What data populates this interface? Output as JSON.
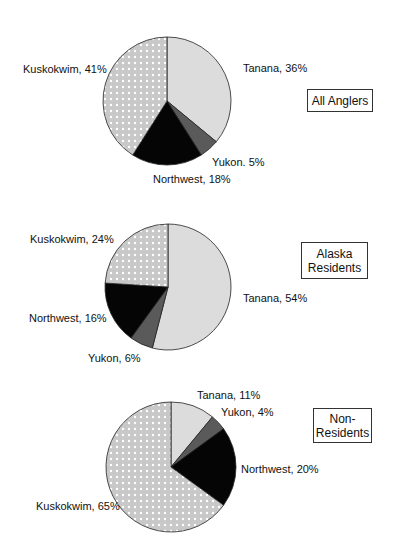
{
  "colors": {
    "Tanana": "#dcdcdc",
    "Yukon": "#5a5a5a",
    "Northwest": "#050505",
    "Kuskokwim": "#c8c8c8",
    "dot": "#ffffff",
    "outline": "#222222"
  },
  "chart_data": [
    {
      "type": "pie",
      "title": "All Anglers",
      "categories": [
        "Tanana",
        "Yukon",
        "Northwest",
        "Kuskokwim"
      ],
      "values": [
        36,
        5,
        18,
        41
      ],
      "labels": [
        "Tanana, 36%",
        "Yukon. 5%",
        "Northwest, 18%",
        "Kuskokwim, 41%"
      ],
      "start_angle_deg": 0,
      "direction": "clockwise"
    },
    {
      "type": "pie",
      "title": "Alaska Residents",
      "title_lines": [
        "Alaska",
        "Residents"
      ],
      "categories": [
        "Tanana",
        "Yukon",
        "Northwest",
        "Kuskokwim"
      ],
      "values": [
        54,
        6,
        16,
        24
      ],
      "labels": [
        "Tanana, 54%",
        "Yukon, 6%",
        "Northwest, 16%",
        "Kuskokwim, 24%"
      ],
      "start_angle_deg": 0,
      "direction": "clockwise"
    },
    {
      "type": "pie",
      "title": "Non-Residents",
      "title_lines": [
        "Non-",
        "Residents"
      ],
      "categories": [
        "Tanana",
        "Yukon",
        "Northwest",
        "Kuskokwim"
      ],
      "values": [
        11,
        4,
        20,
        65
      ],
      "labels": [
        "Tanana, 11%",
        "Yukon, 4%",
        "Northwest, 20%",
        "Kuskokwim, 65%"
      ],
      "start_angle_deg": 0,
      "direction": "clockwise"
    }
  ],
  "layout": [
    {
      "cx": 167,
      "cy": 101,
      "r": 64,
      "label_pos": [
        [
          243,
          72,
          "start"
        ],
        [
          212,
          166,
          "start"
        ],
        [
          153,
          183,
          "start"
        ],
        [
          23,
          73,
          "start"
        ]
      ],
      "box": {
        "left": 307,
        "top": 89,
        "width": 66,
        "height": 23
      }
    },
    {
      "cx": 168,
      "cy": 287,
      "r": 63,
      "label_pos": [
        [
          243,
          302,
          "start"
        ],
        [
          88,
          362,
          "start"
        ],
        [
          29,
          322,
          "start"
        ],
        [
          30,
          243,
          "start"
        ]
      ],
      "box": {
        "left": 301,
        "top": 242,
        "width": 67,
        "height": 37
      }
    },
    {
      "cx": 171,
      "cy": 467,
      "r": 65,
      "label_pos": [
        [
          197,
          399,
          "start"
        ],
        [
          221,
          416,
          "start"
        ],
        [
          241,
          473,
          "start"
        ],
        [
          36,
          510,
          "start"
        ]
      ],
      "box": {
        "left": 313,
        "top": 408,
        "width": 59,
        "height": 35
      }
    }
  ]
}
